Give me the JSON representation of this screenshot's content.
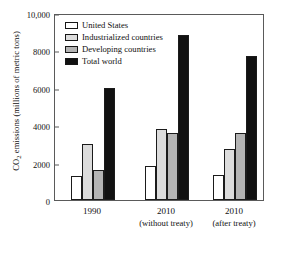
{
  "chart_data": {
    "type": "bar",
    "title": "",
    "xlabel": "",
    "ylabel": "CO2 emissions (millions of metric tons)",
    "ylabel_parts": {
      "pre": "CO",
      "sub": "2",
      "post": " emissions (millions of metric tons)"
    },
    "ylim": [
      0,
      10000
    ],
    "ytick_values": [
      0,
      2000,
      4000,
      6000,
      8000,
      10000
    ],
    "ytick_labels": [
      "0",
      "2000",
      "4000",
      "6000",
      "8000",
      "10,000"
    ],
    "grid": false,
    "legend_position": "top-left",
    "categories": [
      "1990",
      "2010",
      "2010"
    ],
    "category_sublabels": [
      "",
      "(without treaty)",
      "(after treaty)"
    ],
    "series": [
      {
        "name": "United States",
        "color": "#ffffff",
        "values": [
          1300,
          1800,
          1350
        ]
      },
      {
        "name": "Industrialized countries",
        "color": "#dcdcdc",
        "values": [
          3000,
          3800,
          2750
        ]
      },
      {
        "name": "Developing countries",
        "color": "#b4b4b4",
        "values": [
          1600,
          3600,
          3600
        ]
      },
      {
        "name": "Total world",
        "color": "#111111",
        "values": [
          6000,
          8800,
          7700
        ]
      }
    ]
  },
  "legend": {
    "items": [
      {
        "label": "United States",
        "swatch": "#ffffff"
      },
      {
        "label": "Industrialized countries",
        "swatch": "#dcdcdc"
      },
      {
        "label": "Developing countries",
        "swatch": "#b4b4b4"
      },
      {
        "label": "Total world",
        "swatch": "#111111"
      }
    ]
  },
  "axis": {
    "y_title_pre": "CO",
    "y_title_sub": "2",
    "y_title_post": " emissions (millions of metric tons)"
  }
}
